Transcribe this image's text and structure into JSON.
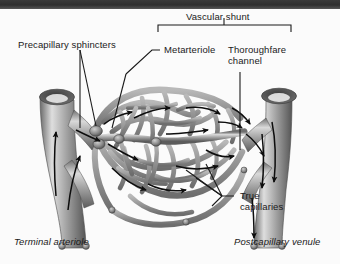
{
  "figure": {
    "topic": "Capillary bed microcirculation",
    "background_color": "#fbfbfb",
    "band_color": "#333333",
    "vessel_color": "#8d8d8d",
    "label_color": "#1a1a1a"
  },
  "labels": {
    "vascular_shunt": "Vascular shunt",
    "precapillary_sphincters": "Precapillary sphincters",
    "metarteriole": "Metarteriole",
    "thoroughfare_channel_l1": "Thoroughfare",
    "thoroughfare_channel_l2": "channel",
    "true_capillaries_l1": "True",
    "true_capillaries_l2": "capillaries",
    "terminal_arteriole": "Terminal arteriole",
    "postcapillary_venule": "Postcapillary venule"
  },
  "structures": [
    {
      "name": "terminal-arteriole",
      "side": "left",
      "flow": "inflow"
    },
    {
      "name": "postcapillary-venule",
      "side": "right",
      "flow": "outflow"
    },
    {
      "name": "metarteriole",
      "side": "center-left",
      "flow": "inflow"
    },
    {
      "name": "thoroughfare-channel",
      "side": "center-right",
      "flow": "outflow"
    },
    {
      "name": "true-capillaries",
      "side": "center",
      "flow": "network"
    },
    {
      "name": "precapillary-sphincters",
      "side": "center-left",
      "flow": "regulator"
    }
  ],
  "flow_arrows": {
    "count": 18,
    "direction": "left-to-right",
    "color": "#111111"
  }
}
